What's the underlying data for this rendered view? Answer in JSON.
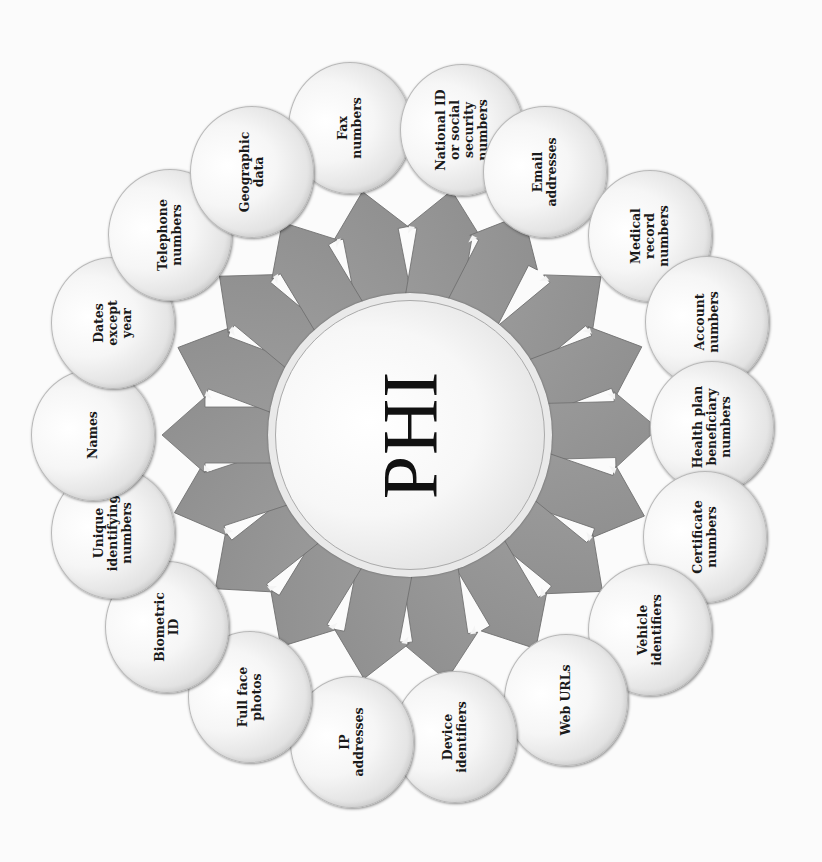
{
  "diagram": {
    "center": {
      "title": "PHI",
      "cx": 410,
      "cy": 435
    },
    "colors": {
      "arrow_fill": "#8e8e8e",
      "arrow_edge": "#6f6f6f",
      "arrow_highlight": "#f4f4f4",
      "bubble_fill": "#f4f4f4",
      "text": "#1a1a1a",
      "background": "#fbfbfb"
    },
    "identifiers": [
      {
        "label": "Fax\nnumbers",
        "x": 350,
        "y": 128
      },
      {
        "label": "National ID\nor social\nsecurity\nnumbers",
        "x": 462,
        "y": 130
      },
      {
        "label": "Email\naddresses",
        "x": 545,
        "y": 172
      },
      {
        "label": "Medical\nrecord\nnumbers",
        "x": 650,
        "y": 236
      },
      {
        "label": "Account\nnumbers",
        "x": 707,
        "y": 322
      },
      {
        "label": "Health plan\nbeneficiary\nnumbers",
        "x": 712,
        "y": 427
      },
      {
        "label": "Certificate\nnumbers",
        "x": 705,
        "y": 537
      },
      {
        "label": "Vehicle\nidentifiers",
        "x": 650,
        "y": 630
      },
      {
        "label": "Web URLs",
        "x": 566,
        "y": 700
      },
      {
        "label": "Device\nidentifiers",
        "x": 455,
        "y": 737
      },
      {
        "label": "IP\naddresses",
        "x": 352,
        "y": 742
      },
      {
        "label": "Full face\nphotos",
        "x": 250,
        "y": 697
      },
      {
        "label": "Biometric\nID",
        "x": 167,
        "y": 627
      },
      {
        "label": "Unique\nidentifying\nnumbers",
        "x": 113,
        "y": 533
      },
      {
        "label": "Names",
        "x": 93,
        "y": 435
      },
      {
        "label": "Dates\nexcept\nyear",
        "x": 113,
        "y": 323
      },
      {
        "label": "Telephone\nnumbers",
        "x": 170,
        "y": 235
      },
      {
        "label": "Geographic\ndata",
        "x": 252,
        "y": 172
      }
    ]
  }
}
